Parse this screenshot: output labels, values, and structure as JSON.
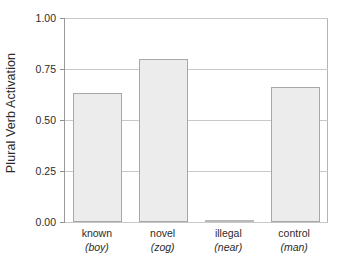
{
  "chart_data": {
    "type": "bar",
    "title": "",
    "xlabel": "",
    "ylabel": "Plural Verb Activation",
    "ylim": [
      0.0,
      1.0
    ],
    "grid": true,
    "legend": "none",
    "categories": [
      "known",
      "novel",
      "illegal",
      "control"
    ],
    "category_examples": [
      "(boy)",
      "(zog)",
      "(near)",
      "(man)"
    ],
    "values": [
      0.63,
      0.8,
      0.005,
      0.66
    ],
    "ytick_labels": [
      "0.00",
      "0.25",
      "0.50",
      "0.75",
      "1.00"
    ],
    "ytick_values": [
      0.0,
      0.25,
      0.5,
      0.75,
      1.0
    ],
    "bar_fill_color": "#ececec",
    "bar_border_color": "#a8a8a8",
    "axis_color": "#9a9a9a",
    "gridline_color": "#c8c8c8",
    "background_color": "#ffffff"
  }
}
